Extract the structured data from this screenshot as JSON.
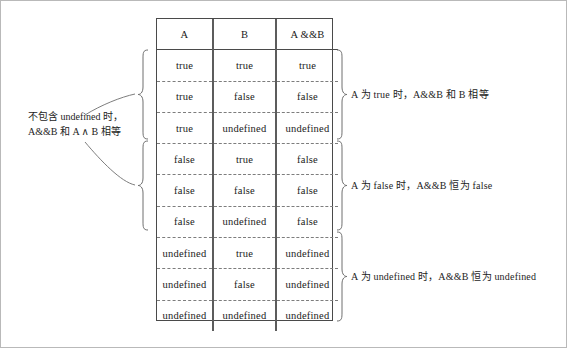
{
  "figure": {
    "background_color": "#ffffff",
    "border_color": "#b9b9b9",
    "line_color": "#4a4a4a",
    "dash_color": "#7d7d7d",
    "brace_color": "#6e6e6e"
  },
  "table": {
    "headers": [
      "A",
      "B",
      "A &&B"
    ],
    "rows": [
      [
        "true",
        "true",
        "true"
      ],
      [
        "true",
        "false",
        "false"
      ],
      [
        "true",
        "undefined",
        "undefined"
      ],
      [
        "false",
        "true",
        "false"
      ],
      [
        "false",
        "false",
        "false"
      ],
      [
        "false",
        "undefined",
        "false"
      ],
      [
        "undefined",
        "true",
        "undefined"
      ],
      [
        "undefined",
        "false",
        "undefined"
      ],
      [
        "undefined",
        "undefined",
        "undefined"
      ]
    ]
  },
  "left_note": {
    "line1": "不包含 undefined 时，",
    "line2": "A&&B 和 A ∧ B 相等"
  },
  "right_notes": [
    {
      "text": "A 为 true 时，A&&B 和 B 相等"
    },
    {
      "text": "A 为 false 时，A&&B 恒为 false"
    },
    {
      "text": "A 为 undefined 时，A&&B 恒为 undefined"
    }
  ]
}
